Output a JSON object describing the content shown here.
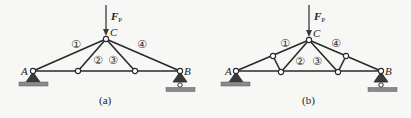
{
  "figure": {
    "panels": [
      {
        "id": "a",
        "caption": "(a)",
        "load": {
          "symbol": "F",
          "subscript": "P"
        },
        "nodes": {
          "A": {
            "label": "A"
          },
          "B": {
            "label": "B"
          },
          "C": {
            "label": "C"
          }
        },
        "members": [
          "①",
          "②",
          "③",
          "④"
        ]
      },
      {
        "id": "b",
        "caption": "(b)",
        "load": {
          "symbol": "F",
          "subscript": "P"
        },
        "nodes": {
          "A": {
            "label": "A"
          },
          "B": {
            "label": "B"
          },
          "C": {
            "label": "C"
          }
        },
        "members": [
          "①",
          "②",
          "③",
          "④"
        ]
      }
    ]
  },
  "colors": {
    "background": "#f7f7f5",
    "member": "#2a2a2a",
    "ground": "#8a8a8a"
  }
}
